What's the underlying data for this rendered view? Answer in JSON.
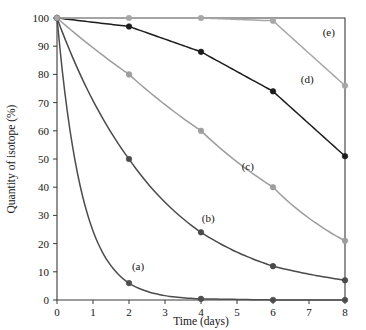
{
  "chart_data": {
    "type": "line",
    "title": "",
    "subtitle": "",
    "xlabel": "Time (days)",
    "ylabel": "Quantity of isotope (%)",
    "xlim": [
      0,
      8
    ],
    "ylim": [
      0,
      100
    ],
    "xticks": [
      0,
      1,
      2,
      3,
      4,
      5,
      6,
      7,
      8
    ],
    "xtick_labels": [
      "0",
      "1",
      "2",
      "3",
      "4",
      "5",
      "6",
      "7",
      "8"
    ],
    "yticks": [
      0,
      10,
      20,
      30,
      40,
      50,
      60,
      70,
      80,
      90,
      100
    ],
    "ytick_labels": [
      "0",
      "10",
      "20",
      "30",
      "40",
      "50",
      "60",
      "70",
      "80",
      "90",
      "100"
    ],
    "grid": false,
    "legend_position": "inline-annotations",
    "x": [
      0,
      2,
      4,
      6,
      8
    ],
    "series": [
      {
        "name": "(a)",
        "label": "(a)",
        "color": "#4d4d4d",
        "marker": "circle",
        "values": [
          100,
          6,
          0.4,
          0.02,
          0
        ],
        "annotation": "(a)",
        "annotation_x": 2.25,
        "annotation_y": 10.5
      },
      {
        "name": "(b)",
        "label": "(b)",
        "color": "#4a4a4a",
        "marker": "circle",
        "values": [
          100,
          50,
          24,
          12,
          7
        ],
        "annotation": "(b)",
        "annotation_x": 4.2,
        "annotation_y": 27.5
      },
      {
        "name": "(c)",
        "label": "(c)",
        "color": "#9d9d9d",
        "marker": "circle",
        "values": [
          100,
          80,
          60,
          40,
          21
        ],
        "annotation": "(c)",
        "annotation_x": 5.3,
        "annotation_y": 46
      },
      {
        "name": "(d)",
        "label": "(d)",
        "color": "#1c1c1c",
        "marker": "circle",
        "values": [
          100,
          97,
          88,
          74,
          51
        ],
        "annotation": "(d)",
        "annotation_x": 6.95,
        "annotation_y": 77
      },
      {
        "name": "(e)",
        "label": "(e)",
        "color": "#a6a6a6",
        "marker": "circle",
        "values": [
          100,
          100,
          100,
          99,
          76
        ],
        "annotation": "(e)",
        "annotation_x": 7.55,
        "annotation_y": 93.5
      }
    ]
  },
  "figure": {
    "background_color": "#ffffff",
    "frame_color": "#3a3a3a",
    "text_color": "#141414"
  }
}
